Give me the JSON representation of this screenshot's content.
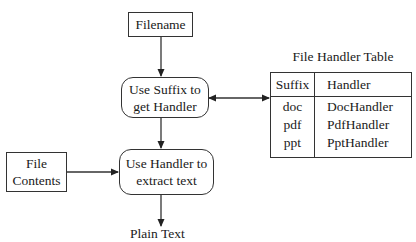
{
  "diagram": {
    "nodes": {
      "filename": {
        "label": "Filename",
        "shape": "rectangle"
      },
      "use_suffix": {
        "line1": "Use Suffix to",
        "line2": "get Handler",
        "shape": "rounded-rectangle"
      },
      "file_contents": {
        "line1": "File",
        "line2": "Contents",
        "shape": "rectangle"
      },
      "use_handler": {
        "line1": "Use Handler to",
        "line2": "extract text",
        "shape": "rounded-rectangle"
      },
      "plain_text": {
        "label": "Plain Text",
        "shape": "text"
      }
    },
    "table": {
      "title": "File Handler Table",
      "columns": [
        "Suffix",
        "Handler"
      ],
      "rows": [
        {
          "suffix": "doc",
          "handler": "DocHandler"
        },
        {
          "suffix": "pdf",
          "handler": "PdfHandler"
        },
        {
          "suffix": "ppt",
          "handler": "PptHandler"
        }
      ]
    },
    "edges": [
      {
        "from": "Filename",
        "to": "Use Suffix to get Handler",
        "type": "directed"
      },
      {
        "from": "Use Suffix to get Handler",
        "to": "File Handler Table",
        "type": "bidirectional"
      },
      {
        "from": "Use Suffix to get Handler",
        "to": "Use Handler to extract text",
        "type": "directed"
      },
      {
        "from": "File Contents",
        "to": "Use Handler to extract text",
        "type": "directed"
      },
      {
        "from": "Use Handler to extract text",
        "to": "Plain Text",
        "type": "directed"
      }
    ],
    "colors": {
      "line": "#333333",
      "background": "#ffffff",
      "text": "#1a1a1a"
    }
  }
}
